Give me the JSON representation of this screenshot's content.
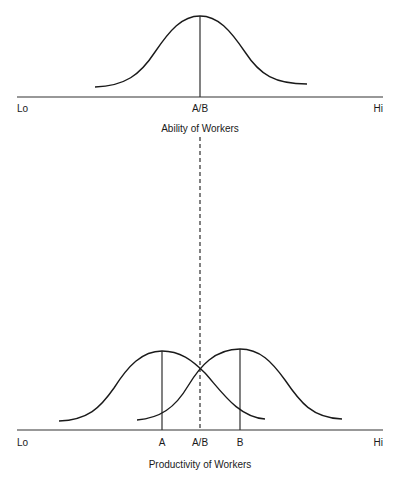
{
  "top_panel": {
    "axis": {
      "lo_label": "Lo",
      "hi_label": "Hi"
    },
    "marker_label": "A/B",
    "title": "Ability of Workers",
    "distribution": {
      "name": "Ability distribution (A and B identical)",
      "mean_label": "A/B"
    }
  },
  "bottom_panel": {
    "axis": {
      "lo_label": "Lo",
      "hi_label": "Hi"
    },
    "marker_labels": {
      "a": "A",
      "ab": "A/B",
      "b": "B"
    },
    "title": "Productivity of Workers",
    "distributions": [
      {
        "name": "Group A productivity",
        "mean_label": "A"
      },
      {
        "name": "Group B productivity",
        "mean_label": "B"
      }
    ]
  },
  "colors": {
    "line": "#1a1a1a",
    "axis": "#333333",
    "background": "#ffffff"
  }
}
